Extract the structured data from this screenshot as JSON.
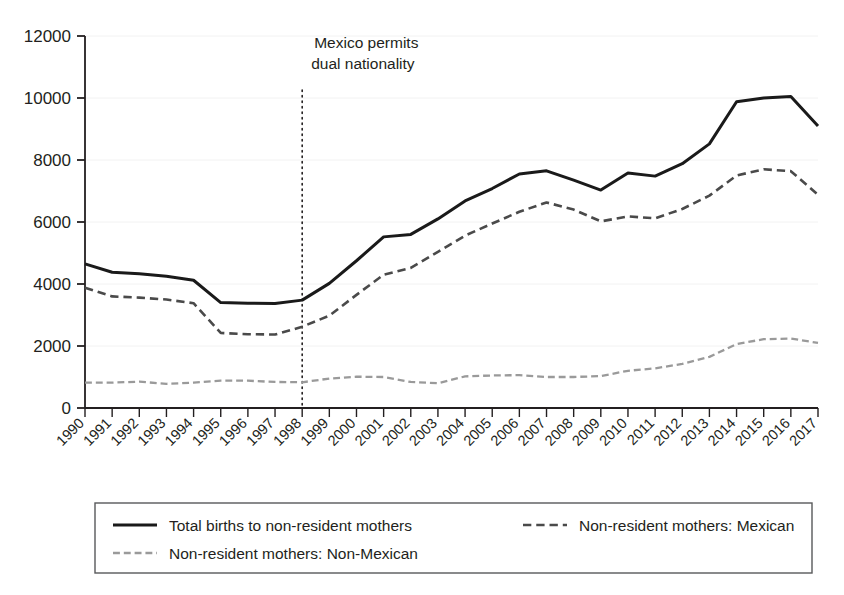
{
  "chart_data": {
    "type": "line",
    "title": "",
    "subtitle": "",
    "xlabel": "",
    "ylabel": "",
    "grid": true,
    "legend_position": "bottom",
    "ylim": [
      0,
      12000
    ],
    "ytick_values": [
      0,
      2000,
      4000,
      6000,
      8000,
      10000,
      12000
    ],
    "ytick_labels": [
      "0",
      "2000",
      "4000",
      "6000",
      "8000",
      "10000",
      "12000"
    ],
    "categories": [
      "1990",
      "1991",
      "1992",
      "1993",
      "1994",
      "1995",
      "1996",
      "1997",
      "1998",
      "1999",
      "2000",
      "2001",
      "2002",
      "2003",
      "2004",
      "2005",
      "2006",
      "2007",
      "2008",
      "2009",
      "2010",
      "2011",
      "2012",
      "2013",
      "2014",
      "2015",
      "2016",
      "2017"
    ],
    "series": [
      {
        "name": "Total births to non-resident mothers",
        "style": "solid",
        "color": "#1a1a1a",
        "width": 3.0,
        "values": [
          4650,
          4380,
          4330,
          4250,
          4120,
          3400,
          3380,
          3370,
          3480,
          4020,
          4750,
          5520,
          5600,
          6100,
          6680,
          7080,
          7550,
          7650,
          7350,
          7030,
          7580,
          7480,
          7880,
          8520,
          9880,
          10000,
          10050,
          9100
        ]
      },
      {
        "name": "Non-resident mothers: Mexican",
        "style": "dashed",
        "color": "#4a4a4a",
        "width": 2.6,
        "values": [
          3880,
          3600,
          3560,
          3500,
          3380,
          2420,
          2380,
          2370,
          2620,
          2980,
          3650,
          4300,
          4520,
          5040,
          5560,
          5950,
          6330,
          6630,
          6400,
          6020,
          6180,
          6120,
          6420,
          6850,
          7500,
          7700,
          7640,
          6880
        ]
      },
      {
        "name": "Non-resident mothers: Non-Mexican",
        "style": "fine-dashed",
        "color": "#9a9a9a",
        "width": 2.3,
        "values": [
          820,
          820,
          850,
          780,
          820,
          880,
          880,
          840,
          830,
          950,
          1010,
          1000,
          840,
          800,
          1020,
          1050,
          1060,
          1000,
          1000,
          1030,
          1200,
          1280,
          1420,
          1650,
          2060,
          2220,
          2240,
          2100
        ]
      }
    ],
    "annotations": [
      {
        "name": "mexico-dual-nationality",
        "line1": "Mexico permits",
        "line2": "dual nationality",
        "at_category": "1998",
        "marker": "vertical-dotted-line"
      }
    ],
    "legend": {
      "entries": [
        {
          "label": "Total births to non-resident mothers",
          "style": "solid",
          "color": "#1a1a1a"
        },
        {
          "label": "Non-resident mothers: Mexican",
          "style": "dashed",
          "color": "#4a4a4a"
        },
        {
          "label": "Non-resident mothers: Non-Mexican",
          "style": "fine-dashed",
          "color": "#9a9a9a"
        }
      ]
    }
  },
  "colors": {
    "axis": "#231f20",
    "grid": "#f2f2f2",
    "background": "#ffffff",
    "legend_border": "#58595b",
    "annotation_line": "#231f20"
  }
}
